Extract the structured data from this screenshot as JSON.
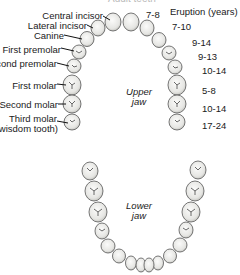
{
  "title": "Adult teeth",
  "eruption_header": "Eruption (years)",
  "tooth_labels": [
    {
      "name": "Central incisor",
      "eruption": "7-8"
    },
    {
      "name": "Lateral incisor",
      "eruption": "7-10"
    },
    {
      "name": "Canine",
      "eruption": "9-14"
    },
    {
      "name": "First premolar",
      "eruption": "9-13"
    },
    {
      "name": "Second premolar",
      "eruption": "10-14"
    },
    {
      "name": "First molar",
      "eruption": "5-8"
    },
    {
      "name": "Second molar",
      "eruption": "10-14"
    },
    {
      "name": "Third molar",
      "subname": "(wisdom tooth)",
      "eruption": "17-24"
    }
  ],
  "jaws": {
    "upper": {
      "line1": "Upper",
      "line2": "jaw"
    },
    "lower": {
      "line1": "Lower",
      "line2": "jaw"
    }
  },
  "colors": {
    "tooth_fill": "#f2f2f0",
    "tooth_stroke": "#555555",
    "background": "#ffffff"
  }
}
